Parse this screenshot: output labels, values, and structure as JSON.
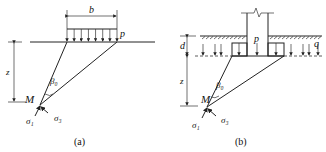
{
  "panels": [
    {
      "id": "a",
      "caption": "(a)",
      "labels": {
        "width": "b",
        "load": "p",
        "depth": "z",
        "point": "M",
        "angle": "β₀",
        "sigma1": "σ₁",
        "sigma3": "σ₃"
      }
    },
    {
      "id": "b",
      "caption": "(b)",
      "labels": {
        "embed": "d",
        "load": "p",
        "surcharge": "q",
        "depth": "z",
        "point": "M",
        "angle": "β₀",
        "sigma1": "σ₁",
        "sigma3": "σ₃"
      }
    }
  ]
}
